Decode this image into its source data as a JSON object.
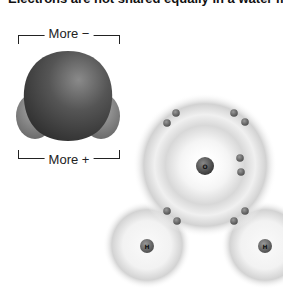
{
  "title_clipped": "Electrons are not shared equally in a water molecule",
  "space_filling_model": {
    "top_label": "More −",
    "bottom_label": "More +",
    "colors": {
      "oxygen": "#555555",
      "hydrogen": "#8a8a8a"
    }
  },
  "electron_shell_model": {
    "atoms": [
      {
        "symbol": "O",
        "x": 205,
        "y": 165,
        "shell_radius": 65
      },
      {
        "symbol": "H",
        "x": 147,
        "y": 245,
        "shell_radius": 42
      },
      {
        "symbol": "H",
        "x": 265,
        "y": 245,
        "shell_radius": 42
      }
    ],
    "electron_count": 10,
    "colors": {
      "electron": "#6a6a6a",
      "shell": "#cfcfcf",
      "nucleus": "#666666"
    }
  }
}
